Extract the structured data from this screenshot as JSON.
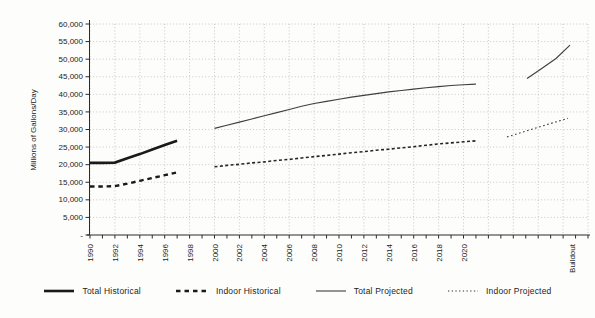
{
  "chart_data": {
    "type": "line",
    "title": "",
    "ylabel": "Millions of Gallons/Day",
    "xlabel": "",
    "y_axis": {
      "min": 0,
      "max": 60000,
      "step": 5000,
      "tick_labels": [
        "-",
        "5,000",
        "10,000",
        "15,000",
        "20,000",
        "25,000",
        "30,000",
        "35,000",
        "40,000",
        "45,000",
        "50,000",
        "55,000",
        "60,000"
      ]
    },
    "x_axis": {
      "tick_labels": [
        "1990",
        "1992",
        "1994",
        "1996",
        "1998",
        "2000",
        "2002",
        "2004",
        "2006",
        "2008",
        "2010",
        "2012",
        "2014",
        "2016",
        "2018",
        "2020"
      ],
      "buildout_label": "Buildout",
      "minor_tick_every_years": 1,
      "gridline_every_years": 2
    },
    "grid": "dotted-both-axes",
    "legend_position": "bottom",
    "series": [
      {
        "id": "total-historical",
        "name": "Total Historical",
        "points": [
          [
            1990,
            20500
          ],
          [
            1991,
            20500
          ],
          [
            1992,
            20600
          ],
          [
            1993,
            21800
          ],
          [
            1994,
            23000
          ],
          [
            1995,
            24300
          ],
          [
            1996,
            25600
          ],
          [
            1997,
            26800
          ]
        ]
      },
      {
        "id": "indoor-historical",
        "name": "Indoor Historical",
        "points": [
          [
            1990,
            13800
          ],
          [
            1991,
            13800
          ],
          [
            1992,
            13900
          ],
          [
            1993,
            14600
          ],
          [
            1994,
            15400
          ],
          [
            1995,
            16200
          ],
          [
            1996,
            17000
          ],
          [
            1997,
            17800
          ]
        ]
      },
      {
        "id": "total-projected",
        "name": "Total Projected",
        "points": [
          [
            2000,
            30300
          ],
          [
            2001,
            31200
          ],
          [
            2002,
            32100
          ],
          [
            2003,
            33000
          ],
          [
            2004,
            33900
          ],
          [
            2005,
            34800
          ],
          [
            2006,
            35700
          ],
          [
            2007,
            36600
          ],
          [
            2008,
            37400
          ],
          [
            2009,
            38000
          ],
          [
            2010,
            38600
          ],
          [
            2011,
            39200
          ],
          [
            2012,
            39700
          ],
          [
            2013,
            40200
          ],
          [
            2014,
            40700
          ],
          [
            2015,
            41100
          ],
          [
            2016,
            41500
          ],
          [
            2017,
            41900
          ],
          [
            2018,
            42200
          ],
          [
            2019,
            42500
          ],
          [
            2020,
            42700
          ],
          [
            2021,
            42900
          ]
        ]
      },
      {
        "id": "indoor-projected",
        "name": "Indoor Projected",
        "points": [
          [
            2000,
            19400
          ],
          [
            2001,
            19800
          ],
          [
            2002,
            20100
          ],
          [
            2003,
            20500
          ],
          [
            2004,
            20800
          ],
          [
            2005,
            21200
          ],
          [
            2006,
            21500
          ],
          [
            2007,
            21900
          ],
          [
            2008,
            22300
          ],
          [
            2009,
            22600
          ],
          [
            2010,
            23000
          ],
          [
            2011,
            23400
          ],
          [
            2012,
            23700
          ],
          [
            2013,
            24100
          ],
          [
            2014,
            24400
          ],
          [
            2015,
            24800
          ],
          [
            2016,
            25100
          ],
          [
            2017,
            25500
          ],
          [
            2018,
            25900
          ],
          [
            2019,
            26200
          ],
          [
            2020,
            26500
          ],
          [
            2021,
            26800
          ]
        ]
      }
    ],
    "buildout_segments": {
      "total_projected_values": [
        44500,
        47200,
        50200,
        54000
      ],
      "indoor_projected_values": [
        27900,
        33200
      ]
    },
    "legend": [
      {
        "label": "Total Historical",
        "style": "solid-thick"
      },
      {
        "label": "Indoor Historical",
        "style": "dashed-thick"
      },
      {
        "label": "Total Projected",
        "style": "solid-thin"
      },
      {
        "label": "Indoor Projected",
        "style": "dotted-thin"
      }
    ],
    "colors": {
      "line_dark": "#1a1a1a",
      "line_projected": "#3f3f3f",
      "gridline": "#bdbdbd",
      "axis": "#2b2b2b",
      "text": "#222222",
      "background": "#fdfdfc"
    }
  }
}
